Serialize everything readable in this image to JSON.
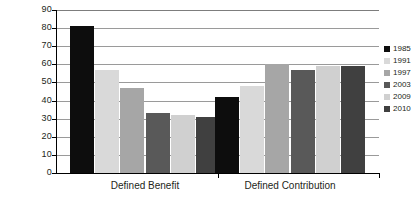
{
  "chart_data": {
    "type": "bar",
    "title": "",
    "xlabel": "",
    "ylabel": "",
    "categories": [
      "Defined Benefit",
      "Defined Contribution"
    ],
    "series": [
      {
        "name": "1985",
        "color": "#0d0d0d",
        "values": [
          81,
          42
        ]
      },
      {
        "name": "1991",
        "color": "#d9d9d9",
        "values": [
          57,
          48
        ]
      },
      {
        "name": "1997",
        "color": "#a6a6a6",
        "values": [
          47,
          60
        ]
      },
      {
        "name": "2003",
        "color": "#595959",
        "values": [
          33,
          57
        ]
      },
      {
        "name": "2009",
        "color": "#d0d0d0",
        "values": [
          32,
          59
        ]
      },
      {
        "name": "2010",
        "color": "#404040",
        "values": [
          31,
          59
        ]
      }
    ],
    "ylim": [
      0,
      90
    ],
    "yticks": [
      0,
      10,
      20,
      30,
      40,
      50,
      60,
      70,
      80,
      90
    ],
    "ytick_labels": [
      "0",
      "10",
      "20",
      "30",
      "40",
      "50",
      "60",
      "70",
      "80",
      "90"
    ],
    "grid": true,
    "legend_position": "right",
    "legend_entries": [
      "1985",
      "1991",
      "1997",
      "2003",
      "2009",
      "2010"
    ]
  },
  "axis": {
    "gridline_color": "#9a9a9a",
    "axis_color": "#000000",
    "label_color": "#231f20"
  }
}
